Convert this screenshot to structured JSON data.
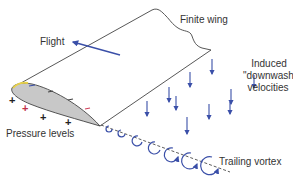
{
  "diagram": {
    "labels": {
      "flight": "Flight",
      "finite_wing": "Finite wing",
      "induced_line1": "Induced",
      "induced_line2": "\"downwash\"",
      "induced_line3": "velocities",
      "pressure_levels": "Pressure levels",
      "trailing_vortex": "Trailing vortex"
    },
    "pressure_signs": {
      "lower_surface": [
        "+",
        "+",
        "+",
        "+"
      ],
      "upper_surface": [
        "−",
        "−",
        "−",
        "−"
      ]
    },
    "colors": {
      "arrow_blue": "#3a4fa8",
      "outline": "#444444",
      "airfoil_fill": "#c8c8c8",
      "leading_edge_highlight": "#e8d24a",
      "negative_red": "#d0405a",
      "text": "#333333"
    },
    "downwash_arrow_count": 10,
    "vortex_ring_count": 7
  }
}
